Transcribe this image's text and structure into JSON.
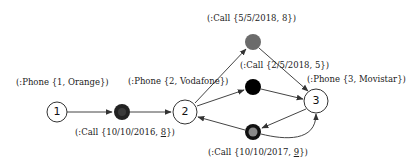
{
  "diagram": {
    "phones": [
      {
        "id": "1",
        "label": "(:Phone {1, Orange})"
      },
      {
        "id": "2",
        "label": "(:Phone {2, Vodafone})"
      },
      {
        "id": "3",
        "label": "(:Phone {3, Movistar})"
      }
    ],
    "calls": [
      {
        "id": "call-a",
        "label_prefix": "(:Call {10/10/2016, ",
        "label_value": "8",
        "label_suffix": "})",
        "value_underlined": true,
        "from": "1",
        "to": "2",
        "fill": "#222222",
        "inner": "#3a3a3a"
      },
      {
        "id": "call-top",
        "label_prefix": "(:Call {5/5/2018, ",
        "label_value": "8",
        "label_suffix": "})",
        "value_underlined": false,
        "from": "2",
        "to": "3",
        "fill": "#6b6b6b",
        "inner": "#6b6b6b"
      },
      {
        "id": "call-mid",
        "label_prefix": "(:Call {2/5/2018, ",
        "label_value": "5",
        "label_suffix": "})",
        "value_underlined": false,
        "from": "2",
        "to": "3",
        "fill": "#000000",
        "inner": "#000000"
      },
      {
        "id": "call-bottom",
        "label_prefix": "(:Call {10/10/2017, ",
        "label_value": "9",
        "label_suffix": "})",
        "value_underlined": true,
        "from": "3",
        "to": "2",
        "fill": "#111111",
        "inner": "#8a8a8a"
      }
    ]
  }
}
